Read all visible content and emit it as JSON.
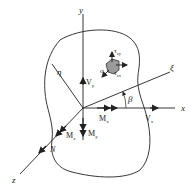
{
  "diagram": {
    "axes": {
      "y": "y",
      "x": "x",
      "z": "z",
      "xi": "ξ",
      "eta": "η"
    },
    "angle": "β",
    "forces": {
      "Vy": "V",
      "Vy_sub": "y",
      "Vx": "V",
      "Vx_sub": "x",
      "Mx": "M",
      "Mx_sub": "x",
      "My": "M",
      "My_sub": "y",
      "Mz": "M",
      "Mz_sub": "z",
      "N": "N"
    },
    "stresses": {
      "tau_zy": "τ",
      "tau_zy_sub": "zy",
      "tau_zx": "τ",
      "tau_zx_sub": "zx",
      "sigma_z": "σ",
      "sigma_z_sub": "z"
    },
    "colors": {
      "line": "#222222",
      "element_fill": "#9a9a9a"
    }
  }
}
